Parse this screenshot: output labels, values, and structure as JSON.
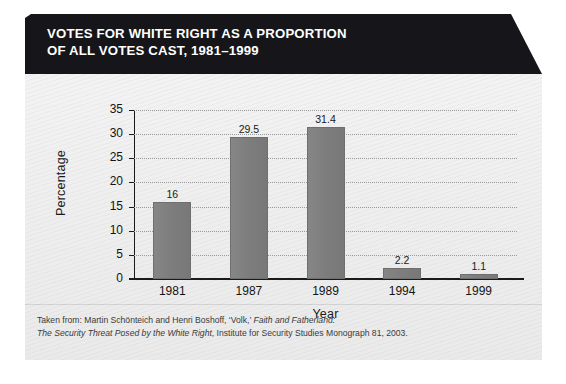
{
  "figure": {
    "title_line1": "VOTES FOR WHITE RIGHT AS A PROPORTION",
    "title_line2": "OF ALL VOTES CAST, 1981–1999",
    "caption_line1_prefix": "Taken from: Martin Schönteich and Henri Boshoff, ‘Volk,’ ",
    "caption_line1_italic": "Faith and Fatherland:",
    "caption_line2_italic": "The Security Threat Posed by the White Right",
    "caption_line2_suffix": ", Institute for Security Studies Monograph 81, 2003.",
    "bar_color": "#7d7d7d",
    "banner_color": "#16161a",
    "panel_color": "#efefef"
  },
  "chart_data": {
    "type": "bar",
    "title": "VOTES FOR WHITE RIGHT AS A PROPORTION OF ALL VOTES CAST, 1981–1999",
    "categories": [
      "1981",
      "1987",
      "1989",
      "1994",
      "1999"
    ],
    "values": [
      16,
      29.5,
      31.4,
      2.2,
      1.1
    ],
    "value_labels": [
      "16",
      "29.5",
      "31.4",
      "2.2",
      "1.1"
    ],
    "xlabel": "Year",
    "ylabel": "Percentage",
    "ylim": [
      0,
      35
    ],
    "yticks": [
      0,
      5,
      10,
      15,
      20,
      25,
      30,
      35
    ],
    "ytick_labels": [
      "0",
      "5",
      "10",
      "15",
      "20",
      "25",
      "30",
      "35"
    ],
    "grid": true,
    "legend": false
  }
}
